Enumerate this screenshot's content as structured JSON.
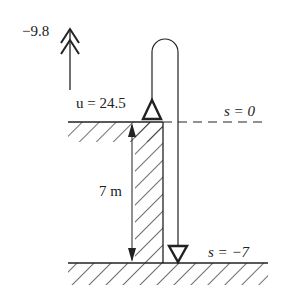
{
  "diagram": {
    "acceleration_label": "−9.8",
    "initial_velocity_label": "u = 24.5",
    "top_level_label": "s = 0",
    "bottom_level_label": "s = −7",
    "height_label": "7 m"
  },
  "colors": {
    "ink": "#222222",
    "background": "#ffffff"
  }
}
